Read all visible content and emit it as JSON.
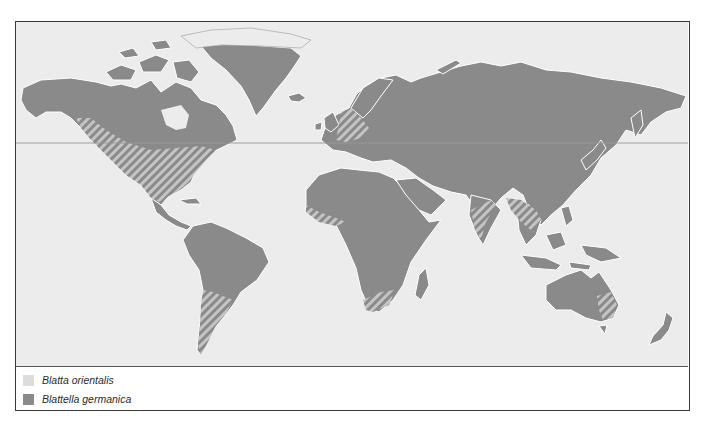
{
  "map": {
    "type": "world distribution map",
    "colors": {
      "ocean": "#ececec",
      "blatta_orientalis": "#dcdcdc",
      "blattella_germanica": "#8a8a8a",
      "overlap_stripe_light": "#c8c8c8",
      "overlap_stripe_dark": "#8a8a8a"
    }
  },
  "legend": {
    "items": [
      {
        "label": "Blatta orientalis",
        "color": "#dcdcdc",
        "icon": "light-grey-swatch"
      },
      {
        "label": "Blattella germanica",
        "color": "#8a8a8a",
        "icon": "dark-grey-swatch"
      }
    ]
  }
}
